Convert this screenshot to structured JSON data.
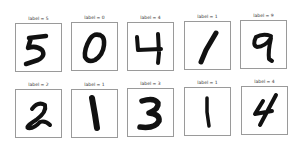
{
  "figure": {
    "rows": [
      [
        {
          "label": "label = 5",
          "digit": "5"
        },
        {
          "label": "label = 0",
          "digit": "0"
        },
        {
          "label": "label = 4",
          "digit": "4"
        },
        {
          "label": "label = 1",
          "digit": "1"
        },
        {
          "label": "label = 9",
          "digit": "9"
        }
      ],
      [
        {
          "label": "label = 2",
          "digit": "2"
        },
        {
          "label": "label = 1",
          "digit": "1"
        },
        {
          "label": "label = 3",
          "digit": "3"
        },
        {
          "label": "label = 1",
          "digit": "1"
        },
        {
          "label": "label = 4",
          "digit": "4"
        }
      ]
    ]
  }
}
